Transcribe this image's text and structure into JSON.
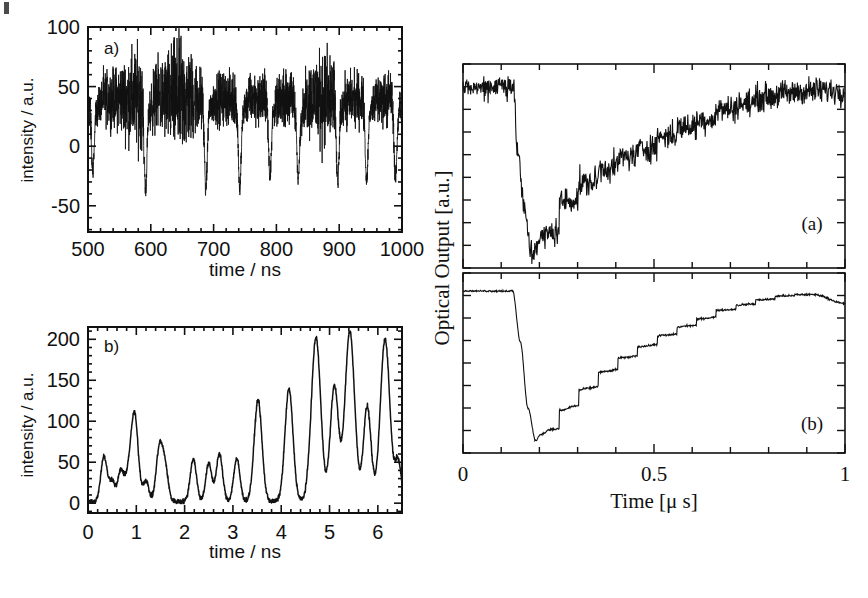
{
  "figure": {
    "background": "#ffffff",
    "ink": "#111111",
    "panel_count": 4
  },
  "left_top": {
    "panel_label": "a)",
    "xlabel": "time / ns",
    "ylabel": "intensity / a.u.",
    "xticks": [
      "500",
      "600",
      "700",
      "800",
      "900",
      "1000"
    ],
    "yticks": [
      "100",
      "50",
      "0",
      "-50"
    ]
  },
  "left_bottom": {
    "panel_label": "b)",
    "xlabel": "time / ns",
    "ylabel": "intensity / a.u.",
    "xticks": [
      "0",
      "1",
      "2",
      "3",
      "4",
      "5",
      "6"
    ],
    "yticks": [
      "200",
      "150",
      "100",
      "50",
      "0"
    ]
  },
  "right": {
    "ylabel": "Optical Output [a.u.]",
    "xlabel": "Time [μ s]",
    "xticks": [
      "0",
      "0.5",
      "1"
    ],
    "top_panel_label": "(a)",
    "bottom_panel_label": "(b)"
  },
  "chart_data": [
    {
      "id": "left-top",
      "type": "line",
      "title": "",
      "panel_label": "a)",
      "xlabel": "time / ns",
      "ylabel": "intensity / a.u.",
      "xlim": [
        500,
        1000
      ],
      "ylim": [
        -72,
        100
      ],
      "xticks": [
        500,
        600,
        700,
        800,
        900,
        1000
      ],
      "yticks": [
        100,
        50,
        0,
        -50
      ],
      "xminor_step": 20,
      "yminor_step": 10,
      "grid": false,
      "legend": "none",
      "description": "Noisy pulsed intensity trace: high-noise plateau near 40 a.u. interrupted by ~9 deep negative dropouts reaching about -30 to -65 a.u.",
      "dropout_times": [
        508,
        592,
        688,
        742,
        790,
        835,
        898,
        944,
        990
      ],
      "dropout_depths": [
        -45,
        -65,
        -66,
        -67,
        -50,
        -56,
        -58,
        -55,
        -52
      ],
      "plateau_mean": 40,
      "plateau_noise_amplitude": 22,
      "plateau_noise_peaks": [
        578,
        645,
        875
      ],
      "plateau_peak_values": [
        77,
        91,
        75
      ]
    },
    {
      "id": "left-bottom",
      "type": "line",
      "panel_label": "b)",
      "xlabel": "time / ns",
      "ylabel": "intensity / a.u.",
      "xlim": [
        0,
        6.5
      ],
      "ylim": [
        -12,
        215
      ],
      "xticks": [
        0,
        1,
        2,
        3,
        4,
        5,
        6
      ],
      "yticks": [
        200,
        150,
        100,
        50,
        0
      ],
      "xminor_step": 0.2,
      "yminor_step": 10,
      "grid": false,
      "legend": "none",
      "description": "Train of sharp pulses of growing amplitude; peak heights rise from ~55 near t=0.35 ns to ~208 near t=5.4 ns.",
      "peaks": [
        {
          "t": 0.33,
          "y": 55
        },
        {
          "t": 0.5,
          "y": 25
        },
        {
          "t": 0.68,
          "y": 38
        },
        {
          "t": 0.82,
          "y": 22
        },
        {
          "t": 0.96,
          "y": 108
        },
        {
          "t": 1.2,
          "y": 25
        },
        {
          "t": 1.48,
          "y": 66
        },
        {
          "t": 1.6,
          "y": 38
        },
        {
          "t": 2.18,
          "y": 52
        },
        {
          "t": 2.5,
          "y": 46
        },
        {
          "t": 2.72,
          "y": 58
        },
        {
          "t": 3.08,
          "y": 52
        },
        {
          "t": 3.52,
          "y": 124
        },
        {
          "t": 4.16,
          "y": 137
        },
        {
          "t": 4.72,
          "y": 200
        },
        {
          "t": 5.1,
          "y": 141
        },
        {
          "t": 5.42,
          "y": 208
        },
        {
          "t": 5.78,
          "y": 116
        },
        {
          "t": 6.15,
          "y": 199
        },
        {
          "t": 6.42,
          "y": 50
        }
      ]
    },
    {
      "id": "right-top",
      "type": "line",
      "panel_label": "(a)",
      "xlabel": "Time [μ s]",
      "ylabel": "Optical Output [a.u.]",
      "xlim": [
        0,
        1
      ],
      "ylim": [
        0,
        1
      ],
      "xticks": [
        0,
        0.5,
        1
      ],
      "xminor_step": 0.1,
      "yticks": [],
      "grid": false,
      "legend": "none",
      "description": "Noisy optical output: flat high level until t=0.13 us, sharp drop to minimum ~0.07 at t=0.18 us, then noisy staircase recovery back to the initial level by t=0.9 us.",
      "keypoints": [
        {
          "t": 0.0,
          "y": 0.88
        },
        {
          "t": 0.13,
          "y": 0.9
        },
        {
          "t": 0.145,
          "y": 0.55
        },
        {
          "t": 0.16,
          "y": 0.28
        },
        {
          "t": 0.18,
          "y": 0.07
        },
        {
          "t": 0.2,
          "y": 0.14
        },
        {
          "t": 0.23,
          "y": 0.27
        },
        {
          "t": 0.27,
          "y": 0.36
        },
        {
          "t": 0.32,
          "y": 0.43
        },
        {
          "t": 0.38,
          "y": 0.52
        },
        {
          "t": 0.45,
          "y": 0.58
        },
        {
          "t": 0.52,
          "y": 0.65
        },
        {
          "t": 0.6,
          "y": 0.72
        },
        {
          "t": 0.7,
          "y": 0.8
        },
        {
          "t": 0.8,
          "y": 0.85
        },
        {
          "t": 0.9,
          "y": 0.87
        },
        {
          "t": 1.0,
          "y": 0.87
        }
      ],
      "noise_amplitude": 0.05
    },
    {
      "id": "right-bottom",
      "type": "line",
      "panel_label": "(b)",
      "xlabel": "Time [μ s]",
      "ylabel": "Optical Output [a.u.]",
      "xlim": [
        0,
        1
      ],
      "ylim": [
        0,
        1
      ],
      "xticks": [
        0,
        0.5,
        1
      ],
      "xminor_step": 0.1,
      "yticks": [],
      "grid": false,
      "legend": "none",
      "description": "Smooth (simulated) optical output: flat high level until t=0.13 us, drop to minimum ~0.07 at t=0.19 us, then clean staircase recovery peaking near t=0.88 us and slightly rolling off at t=1.",
      "keypoints": [
        {
          "t": 0.0,
          "y": 0.9
        },
        {
          "t": 0.13,
          "y": 0.9
        },
        {
          "t": 0.15,
          "y": 0.62
        },
        {
          "t": 0.17,
          "y": 0.25
        },
        {
          "t": 0.19,
          "y": 0.07
        },
        {
          "t": 0.21,
          "y": 0.13
        },
        {
          "t": 0.225,
          "y": 0.22
        },
        {
          "t": 0.26,
          "y": 0.24
        },
        {
          "t": 0.29,
          "y": 0.33
        },
        {
          "t": 0.33,
          "y": 0.4
        },
        {
          "t": 0.37,
          "y": 0.47
        },
        {
          "t": 0.42,
          "y": 0.54
        },
        {
          "t": 0.47,
          "y": 0.6
        },
        {
          "t": 0.53,
          "y": 0.67
        },
        {
          "t": 0.6,
          "y": 0.74
        },
        {
          "t": 0.68,
          "y": 0.8
        },
        {
          "t": 0.76,
          "y": 0.85
        },
        {
          "t": 0.85,
          "y": 0.88
        },
        {
          "t": 0.92,
          "y": 0.88
        },
        {
          "t": 1.0,
          "y": 0.83
        }
      ],
      "noise_amplitude": 0.004
    }
  ]
}
